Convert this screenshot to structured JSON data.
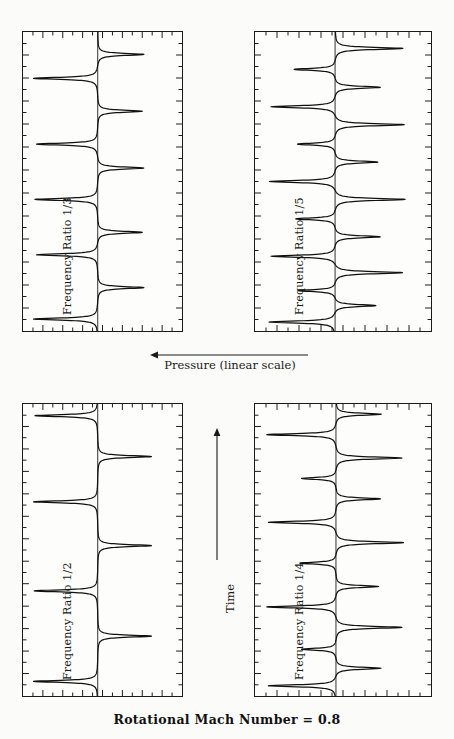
{
  "figure": {
    "caption": "Rotational Mach Number = 0.8",
    "x_axis_label": "Pressure (linear scale)",
    "x_axis_arrow": "left-arrow",
    "y_axis_label": "Time",
    "y_axis_arrow": "up-arrow",
    "common_label_prefix": "Frequency   Ratio"
  },
  "panels": [
    {
      "id": "panel-top-left",
      "ratio": "1/3",
      "label": "Frequency   Ratio    1/3",
      "position": {
        "x": 22,
        "y": 31,
        "w": 161,
        "h": 301
      }
    },
    {
      "id": "panel-top-right",
      "ratio": "1/5",
      "label": "Frequency   Ratio    1/5",
      "position": {
        "x": 254,
        "y": 31,
        "w": 178,
        "h": 301
      }
    },
    {
      "id": "panel-bottom-left",
      "ratio": "1/2",
      "label": "Frequency   Ratio    1/2",
      "position": {
        "x": 22,
        "y": 403,
        "w": 161,
        "h": 294
      }
    },
    {
      "id": "panel-bottom-right",
      "ratio": "1/4",
      "label": "Frequency   Ratio    1/4",
      "position": {
        "x": 254,
        "y": 403,
        "w": 178,
        "h": 294
      }
    }
  ],
  "chart_data": {
    "type": "line",
    "title": "Rotational Mach Number = 0.8",
    "xlabel": "Pressure (linear scale)",
    "ylabel": "Time",
    "orientation": "rotated",
    "note": "Four stacked pressure-vs-time traces; horizontal axis is pressure (linear, increasing to the left), vertical axis is time (increasing upward). Each panel shows a periodic train of sharp pressure spikes whose repetition rate is set by the labelled frequency ratio. A vertical reference line marks the mean pressure level in each panel.",
    "grid": false,
    "legend": false,
    "xlim": [
      0,
      1
    ],
    "ylim": [
      0,
      1
    ],
    "series": [
      {
        "name": "1/3",
        "panel": "panel-top-left",
        "frequency_ratio": 0.3333,
        "reference_line_x": 0.47,
        "spike_count": 8,
        "spike_times": [
          0.04,
          0.145,
          0.255,
          0.33,
          0.44,
          0.545,
          0.625,
          0.735,
          0.845,
          0.925
        ],
        "spike_amplitudes": [
          0.86,
          -0.62,
          0.82,
          -0.6,
          0.84,
          -0.62,
          0.82,
          -0.6,
          0.86,
          -0.62
        ],
        "baseline": 0.0
      },
      {
        "name": "1/5",
        "panel": "panel-top-right",
        "frequency_ratio": 0.2,
        "reference_line_x": 0.455,
        "spike_count": 14,
        "spike_times": [
          0.03,
          0.085,
          0.135,
          0.195,
          0.25,
          0.315,
          0.375,
          0.44,
          0.5,
          0.565,
          0.625,
          0.69,
          0.75,
          0.815,
          0.875,
          0.945
        ],
        "spike_amplitudes": [
          0.8,
          -0.5,
          0.45,
          -0.82,
          0.78,
          -0.55,
          0.48,
          -0.85,
          0.8,
          -0.52,
          0.46,
          -0.84,
          0.78,
          -0.55,
          0.5,
          -0.82
        ],
        "baseline": 0.0
      },
      {
        "name": "1/2",
        "panel": "panel-bottom-left",
        "frequency_ratio": 0.5,
        "reference_line_x": 0.47,
        "spike_count": 6,
        "spike_times": [
          0.05,
          0.205,
          0.36,
          0.515,
          0.665,
          0.82,
          0.96
        ],
        "spike_amplitudes": [
          0.86,
          -0.72,
          0.85,
          -0.72,
          0.86,
          -0.72,
          0.84
        ],
        "baseline": 0.0
      },
      {
        "name": "1/4",
        "panel": "panel-bottom-right",
        "frequency_ratio": 0.25,
        "reference_line_x": 0.46,
        "spike_count": 11,
        "spike_times": [
          0.035,
          0.095,
          0.16,
          0.235,
          0.305,
          0.375,
          0.455,
          0.525,
          0.595,
          0.675,
          0.745,
          0.815,
          0.895,
          0.965
        ],
        "spike_amplitudes": [
          0.82,
          -0.55,
          0.42,
          -0.8,
          0.84,
          -0.52,
          0.44,
          -0.82,
          0.82,
          -0.54,
          0.42,
          -0.8,
          0.84,
          -0.55
        ],
        "baseline": 0.0
      }
    ],
    "axis_ticks": {
      "description": "Inward tick marks on all four sides of each frame; major ticks longer than minor ticks, no numeric tick labels shown.",
      "labeled": false
    }
  }
}
